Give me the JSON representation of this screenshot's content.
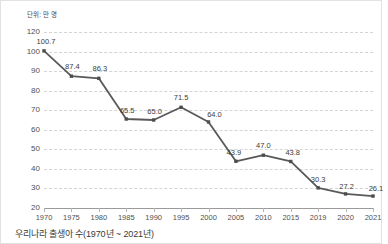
{
  "caption": "우리나라 출생아 수(1970년 ~ 2021년)",
  "unit_label": "단위: 만 명",
  "chart_data": {
    "type": "line",
    "title": "우리나라 출생아 수(1970년 ~ 2021년)",
    "subtitle": "",
    "xlabel": "",
    "ylabel": "단위: 만 명",
    "unit": "만 명",
    "grid": true,
    "legend": "none",
    "line_color": "#595959",
    "marker": "square",
    "marker_color": "#4d4d4d",
    "gridline_color": "#d4d4d4",
    "axis_color": "#9a9a9a",
    "ylim": [
      20,
      120
    ],
    "yticks": [
      20,
      30,
      40,
      50,
      60,
      70,
      80,
      90,
      100,
      120
    ],
    "ytick_labels": [
      "20",
      "30",
      "40",
      "50",
      "60",
      "70",
      "80",
      "90",
      "100",
      "120"
    ],
    "categories": [
      "1970",
      "1975",
      "1980",
      "1985",
      "1990",
      "1995",
      "2000",
      "2005",
      "2010",
      "2015",
      "2019",
      "2020",
      "2021"
    ],
    "values": [
      100.7,
      87.4,
      86.3,
      65.5,
      65.0,
      71.5,
      64.0,
      43.9,
      47.0,
      43.8,
      30.3,
      27.2,
      26.1
    ],
    "data_labels": [
      "100.7",
      "87.4",
      "86.3",
      "65.5",
      "65.0",
      "71.5",
      "64.0",
      "43.9",
      "47.0",
      "43.8",
      "30.3",
      "27.2",
      "26.1"
    ]
  }
}
